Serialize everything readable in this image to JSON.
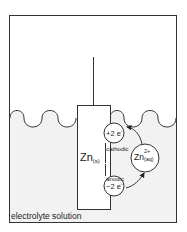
{
  "diagram": {
    "title": "",
    "container_label": "electrolyte solution",
    "electrode": {
      "symbol": "Zn",
      "state": "(s)"
    },
    "ion": {
      "symbol": "Zn",
      "charge": "2+",
      "state": "(aq)"
    },
    "electron_gain": {
      "label": "+2 e",
      "superscript": "-"
    },
    "electron_loss": {
      "label": "−2 e",
      "superscript": "-"
    },
    "currents": {
      "cathodic": {
        "symbol": "I",
        "subscript": "cathodic"
      },
      "anodic": {
        "symbol": "I",
        "subscript": "anodic"
      }
    },
    "colors": {
      "stroke": "#333333",
      "solution_fill": "#f2f2f2",
      "background": "#ffffff"
    }
  }
}
